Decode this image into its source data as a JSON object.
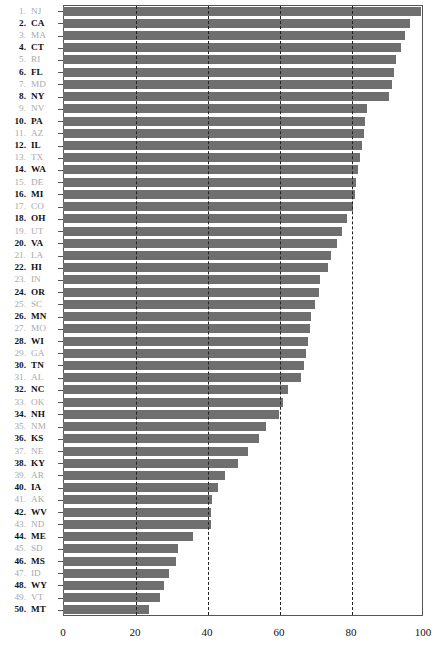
{
  "chart_data": {
    "type": "bar",
    "orientation": "horizontal",
    "title": "",
    "subtitle": "",
    "xlabel": "",
    "ylabel": "",
    "xlim": [
      0,
      100
    ],
    "xticks": [
      0,
      20,
      40,
      60,
      80,
      100
    ],
    "xticklabels": [
      "0",
      "20",
      "40",
      "60",
      "80",
      "100"
    ],
    "gridlines": [
      20,
      40,
      60,
      80
    ],
    "grid": true,
    "grid_style": "dashed-vertical",
    "legend": null,
    "bar_color": "#6f6f6f",
    "axis_color": "#555555",
    "label_color_bold": "#111111",
    "label_color_light": "#a9a9a9",
    "categories": [
      "NJ",
      "CA",
      "MA",
      "CT",
      "RI",
      "FL",
      "MD",
      "NY",
      "NV",
      "PA",
      "AZ",
      "IL",
      "TX",
      "WA",
      "DE",
      "MI",
      "CO",
      "OH",
      "UT",
      "VA",
      "LA",
      "HI",
      "IN",
      "OR",
      "SC",
      "MN",
      "MO",
      "WI",
      "GA",
      "TN",
      "AL",
      "NC",
      "OK",
      "NH",
      "NM",
      "KS",
      "NE",
      "KY",
      "AR",
      "IA",
      "AK",
      "WV",
      "ND",
      "ME",
      "SD",
      "MS",
      "ID",
      "WY",
      "VT",
      "MT"
    ],
    "ranks": [
      "1.",
      "2.",
      "3.",
      "4.",
      "5.",
      "6.",
      "7.",
      "8.",
      "9.",
      "10.",
      "11.",
      "12.",
      "13.",
      "14.",
      "15.",
      "16.",
      "17.",
      "18.",
      "19.",
      "20.",
      "21.",
      "22.",
      "23.",
      "24.",
      "25.",
      "26.",
      "27.",
      "28.",
      "29.",
      "30.",
      "31.",
      "32.",
      "33.",
      "34.",
      "35.",
      "36.",
      "37.",
      "38.",
      "39.",
      "40.",
      "41.",
      "42.",
      "43.",
      "44.",
      "45.",
      "46.",
      "47.",
      "48.",
      "49.",
      "50."
    ],
    "values": [
      99.5,
      96.5,
      95.0,
      94.0,
      92.5,
      92.0,
      91.5,
      90.5,
      84.5,
      84.0,
      83.5,
      83.0,
      82.5,
      82.0,
      81.5,
      81.0,
      80.5,
      79.0,
      77.5,
      76.0,
      74.5,
      73.5,
      71.5,
      71.0,
      70.0,
      69.0,
      68.5,
      68.0,
      67.5,
      67.0,
      66.0,
      62.5,
      61.0,
      60.0,
      56.5,
      54.5,
      51.5,
      48.5,
      45.0,
      43.0,
      41.5,
      41.0,
      41.0,
      36.0,
      32.0,
      31.5,
      29.5,
      28.0,
      27.0,
      24.0
    ]
  }
}
